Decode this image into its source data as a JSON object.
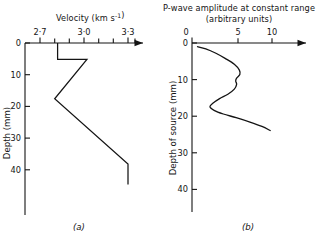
{
  "figure": {
    "panels": [
      {
        "key": "a",
        "sub_label": "(a)",
        "title_line1": "Velocity (km s",
        "title_sup": "-1",
        "title_line1_close": ")",
        "title_plain": "Velocity (km s^-1)",
        "x_axis": {
          "label": "Velocity (km s^-1)",
          "unit": "km s^-1",
          "tick_labels": [
            "2·7",
            "3·0",
            "3·3"
          ],
          "tick_values": [
            2.7,
            3.0,
            3.3
          ],
          "minor_tick_values": [
            2.75,
            2.8,
            2.85,
            2.9,
            2.95,
            3.05,
            3.1,
            3.15,
            3.2,
            3.25,
            3.35
          ],
          "range": [
            2.68,
            3.42
          ],
          "arrow": true
        },
        "y_axis": {
          "label": "Depth (mm)",
          "unit": "mm",
          "tick_labels": [
            "0",
            "10",
            "20",
            "30",
            "40"
          ],
          "tick_values": [
            0,
            10,
            20,
            30,
            40
          ],
          "range": [
            0,
            46
          ],
          "direction": "down"
        }
      },
      {
        "key": "b",
        "sub_label": "(b)",
        "title_line1": "P-wave amplitude at constant range",
        "title_line2": "(arbitrary units)",
        "x_axis": {
          "label": "P-wave amplitude at constant range (arbitrary units)",
          "unit": "arbitrary units",
          "tick_labels": [
            "0",
            "5",
            "10"
          ],
          "tick_values": [
            0,
            5,
            10
          ],
          "range": [
            0,
            14.5
          ],
          "arrow": true
        },
        "y_axis": {
          "label": "Depth of source (mm)",
          "unit": "mm",
          "tick_labels": [
            "0",
            "10",
            "20",
            "30",
            "40"
          ],
          "tick_values": [
            0,
            10,
            20,
            30,
            40
          ],
          "range": [
            0,
            44
          ],
          "direction": "down"
        }
      }
    ]
  },
  "chart_data": [
    {
      "type": "line",
      "id": "panel-a-velocity-depth-profile",
      "title": "Velocity (km s^-1)",
      "xlabel": "Velocity (km s^-1)",
      "ylabel": "Depth (mm)",
      "xlim": [
        2.68,
        3.42
      ],
      "ylim": [
        46,
        0
      ],
      "y_inverted": true,
      "grid": false,
      "legend": null,
      "xtick_labels": [
        "2·7",
        "3·0",
        "3·3"
      ],
      "xticks": [
        2.7,
        3.0,
        3.3
      ],
      "yticks": [
        0,
        10,
        20,
        30,
        40
      ],
      "series": [
        {
          "name": "velocity profile",
          "style": "piecewise-linear",
          "points": [
            {
              "velocity": 2.82,
              "depth": 0.0
            },
            {
              "velocity": 2.82,
              "depth": 5.2
            },
            {
              "velocity": 3.02,
              "depth": 5.2
            },
            {
              "velocity": 2.8,
              "depth": 17.6
            },
            {
              "velocity": 3.3,
              "depth": 38.2
            },
            {
              "velocity": 3.3,
              "depth": 44.6
            }
          ]
        }
      ]
    },
    {
      "type": "line",
      "id": "panel-b-pwave-amplitude-vs-source-depth",
      "title": "P-wave amplitude at constant range (arbitrary units)",
      "xlabel": "P-wave amplitude at constant range (arbitrary units)",
      "ylabel": "Depth of source (mm)",
      "xlim": [
        0,
        14.5
      ],
      "ylim": [
        44,
        0
      ],
      "y_inverted": true,
      "grid": false,
      "legend": null,
      "xtick_labels": [
        "0",
        "5",
        "10"
      ],
      "xticks": [
        0,
        5,
        10
      ],
      "yticks": [
        0,
        10,
        20,
        30,
        40
      ],
      "series": [
        {
          "name": "P-wave amplitude",
          "style": "smooth",
          "points": [
            {
              "amplitude": 0.6,
              "depth": 1.0
            },
            {
              "amplitude": 1.5,
              "depth": 1.6
            },
            {
              "amplitude": 2.6,
              "depth": 2.8
            },
            {
              "amplitude": 3.6,
              "depth": 4.2
            },
            {
              "amplitude": 4.6,
              "depth": 5.8
            },
            {
              "amplitude": 5.15,
              "depth": 7.4
            },
            {
              "amplitude": 5.2,
              "depth": 8.6
            },
            {
              "amplitude": 4.85,
              "depth": 9.6
            },
            {
              "amplitude": 4.75,
              "depth": 10.4
            },
            {
              "amplitude": 4.85,
              "depth": 11.3
            },
            {
              "amplitude": 4.6,
              "depth": 12.6
            },
            {
              "amplitude": 3.9,
              "depth": 14.0
            },
            {
              "amplitude": 3.0,
              "depth": 15.2
            },
            {
              "amplitude": 2.3,
              "depth": 16.4
            },
            {
              "amplitude": 1.95,
              "depth": 17.4
            },
            {
              "amplitude": 2.4,
              "depth": 18.4
            },
            {
              "amplitude": 3.4,
              "depth": 19.4
            },
            {
              "amplitude": 4.8,
              "depth": 20.4
            },
            {
              "amplitude": 6.3,
              "depth": 21.6
            },
            {
              "amplitude": 7.6,
              "depth": 22.8
            },
            {
              "amplitude": 8.5,
              "depth": 23.9
            }
          ]
        }
      ]
    }
  ]
}
